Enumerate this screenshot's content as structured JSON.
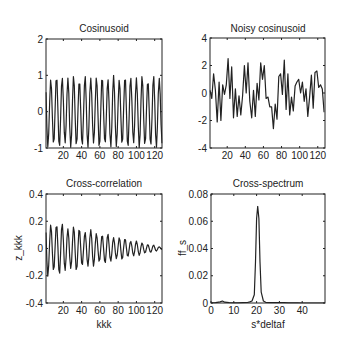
{
  "figure": {
    "width": 342,
    "height": 351,
    "line_color": "#222222",
    "background": "#ffffff"
  },
  "chart_data": [
    {
      "id": "cosinusoid",
      "type": "line",
      "title": "Cosinusoid",
      "xlabel": "",
      "ylabel": "",
      "xlim": [
        1,
        128
      ],
      "ylim": [
        -1,
        2
      ],
      "xticks": [
        20,
        40,
        60,
        80,
        100,
        120
      ],
      "yticks": [
        -1,
        0,
        1,
        2
      ],
      "xtick_labels": [
        "20",
        "40",
        "60",
        "80",
        "100",
        "120"
      ],
      "ytick_labels": [
        "-1",
        "0",
        "1",
        "2"
      ],
      "grid": false,
      "box_px": {
        "left": 46,
        "top": 39,
        "right": 162,
        "bottom": 148
      },
      "generator": {
        "kind": "cosine",
        "amplitude": 1,
        "cycles_per_sample": 0.16,
        "n": 128
      }
    },
    {
      "id": "noisy-cosinusoid",
      "type": "line",
      "title": "Noisy cosinusoid",
      "xlabel": "",
      "ylabel": "",
      "xlim": [
        1,
        128
      ],
      "ylim": [
        -4,
        4
      ],
      "xticks": [
        20,
        40,
        60,
        80,
        100,
        120
      ],
      "yticks": [
        -4,
        -2,
        0,
        2,
        4
      ],
      "xtick_labels": [
        "20",
        "40",
        "60",
        "80",
        "100",
        "120"
      ],
      "ytick_labels": [
        "-4",
        "-2",
        "0",
        "2",
        "4"
      ],
      "grid": false,
      "box_px": {
        "left": 210,
        "top": 38,
        "right": 325,
        "bottom": 148
      },
      "x": [
        1,
        3,
        5,
        7,
        9,
        11,
        13,
        15,
        17,
        19,
        21,
        23,
        25,
        27,
        29,
        31,
        33,
        35,
        37,
        39,
        41,
        43,
        45,
        47,
        49,
        51,
        53,
        55,
        57,
        59,
        61,
        63,
        65,
        67,
        69,
        71,
        73,
        75,
        77,
        79,
        81,
        83,
        85,
        87,
        89,
        91,
        93,
        95,
        97,
        99,
        101,
        103,
        105,
        107,
        109,
        111,
        113,
        115,
        117,
        119,
        121,
        123,
        125,
        127
      ],
      "values": [
        0.2,
        -0.4,
        1.4,
        0.2,
        -2.1,
        0.8,
        -2.0,
        0.6,
        -0.1,
        0.6,
        2.5,
        -0.4,
        1.9,
        -1.8,
        0.3,
        -1.7,
        -0.2,
        -1.6,
        -0.2,
        2.0,
        0.0,
        2.2,
        -0.6,
        -1.8,
        0.2,
        -1.7,
        0.7,
        -0.5,
        2.2,
        1.0,
        2.0,
        -0.4,
        -0.3,
        -1.0,
        -1.0,
        -2.6,
        -0.8,
        -1.9,
        1.2,
        1.4,
        -0.1,
        2.4,
        -1.2,
        1.4,
        -1.6,
        -0.3,
        -1.3,
        0.5,
        0.8,
        1.0,
        0.0,
        0.8,
        -0.6,
        0.3,
        -1.7,
        -0.3,
        1.3,
        -1.1,
        1.5,
        1.6,
        0.4,
        0.6,
        0.3,
        -1.4
      ]
    },
    {
      "id": "cross-correlation",
      "type": "line",
      "title": "Cross-correlation",
      "xlabel": "kkk",
      "ylabel": "z_kkk",
      "xlim": [
        1,
        128
      ],
      "ylim": [
        -0.4,
        0.4
      ],
      "xticks": [
        20,
        40,
        60,
        80,
        100,
        120
      ],
      "yticks": [
        -0.4,
        -0.2,
        0,
        0.2,
        0.4
      ],
      "xtick_labels": [
        "20",
        "40",
        "60",
        "80",
        "100",
        "120"
      ],
      "ytick_labels": [
        "-0.4",
        "-0.2",
        "0",
        "0.2",
        "0.4"
      ],
      "grid": false,
      "box_px": {
        "left": 46,
        "top": 194,
        "right": 162,
        "bottom": 303
      },
      "generator": {
        "kind": "damped-cosine",
        "amplitude": 0.22,
        "cycles_per_sample": 0.16,
        "n": 128,
        "end_amplitude": 0.01
      }
    },
    {
      "id": "cross-spectrum",
      "type": "line",
      "title": "Cross-spectrum",
      "xlabel": "s*deltaf",
      "ylabel": "ff_s",
      "xlim": [
        0,
        50
      ],
      "ylim": [
        0,
        0.08
      ],
      "xticks": [
        0,
        10,
        20,
        30,
        40
      ],
      "yticks": [
        0,
        0.02,
        0.04,
        0.06,
        0.08
      ],
      "xtick_labels": [
        "0",
        "10",
        "20",
        "30",
        "40"
      ],
      "ytick_labels": [
        "0",
        "0.02",
        "0.04",
        "0.06",
        "0.08"
      ],
      "grid": false,
      "box_px": {
        "left": 211,
        "top": 194,
        "right": 325,
        "bottom": 303
      },
      "x": [
        0,
        2,
        4,
        5,
        6,
        8,
        10,
        12,
        14,
        16,
        17,
        18,
        19,
        19.5,
        20,
        20.5,
        21,
        21.5,
        22,
        23,
        24,
        26,
        28,
        30,
        32,
        34,
        36,
        38,
        40,
        42,
        44,
        46,
        48,
        50
      ],
      "values": [
        0,
        0.0003,
        0.0008,
        0.0015,
        0.0006,
        0.0002,
        0.0001,
        0.0001,
        0.0002,
        0.0004,
        0.0008,
        0.0015,
        0.006,
        0.03,
        0.062,
        0.071,
        0.062,
        0.03,
        0.008,
        0.0015,
        0.0005,
        0.0002,
        0.0003,
        0.0004,
        0.0002,
        0.0001,
        0.0001,
        0.0001,
        0,
        0,
        0,
        0,
        0,
        0
      ]
    }
  ]
}
